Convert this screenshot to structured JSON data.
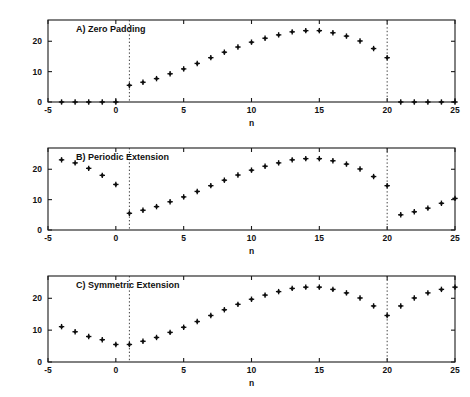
{
  "figure": {
    "title": "",
    "background_color": "#ffffff",
    "marker_color": "#0d0d0d",
    "axis_color": "#1a1a1a",
    "guide_color": "#2b2b2b"
  },
  "panels": [
    {
      "key": "A",
      "title": "A) Zero Padding",
      "xlabel": "n"
    },
    {
      "key": "B",
      "title": "B) Periodic Extension",
      "xlabel": "n"
    },
    {
      "key": "C",
      "title": "C) Symmetric Extension",
      "xlabel": "n"
    }
  ],
  "axes": {
    "xticks": [
      -5,
      0,
      5,
      10,
      15,
      20,
      25
    ],
    "xtick_labels": [
      "-5",
      "0",
      "5",
      "10",
      "15",
      "20",
      "25"
    ],
    "yticks": [
      0,
      10,
      20
    ],
    "ytick_labels": [
      "0",
      "10",
      "20"
    ],
    "xlim": [
      -5,
      25
    ],
    "ylim": [
      0,
      27
    ],
    "xlabel": "n",
    "grid": false,
    "legend": "none",
    "guide_x": [
      1,
      20
    ]
  },
  "chart_data": [
    {
      "type": "scatter",
      "title": "A) Zero Padding",
      "xlabel": "n",
      "ylabel": "",
      "xlim": [
        -5,
        25
      ],
      "ylim": [
        0,
        27
      ],
      "grid": false,
      "legend": "none",
      "marker": "plus-diamond",
      "annotations": [
        "dotted vertical line at n=1",
        "dotted vertical line at n=20"
      ],
      "x": [
        -4,
        -3,
        -2,
        -1,
        0,
        1,
        2,
        3,
        4,
        5,
        6,
        7,
        8,
        9,
        10,
        11,
        12,
        13,
        14,
        15,
        16,
        17,
        18,
        19,
        20,
        21,
        22,
        23,
        24,
        25
      ],
      "values": [
        0,
        0,
        0,
        0,
        0,
        5.5,
        6.5,
        7.7,
        9.3,
        10.9,
        12.7,
        14.6,
        16.4,
        18.1,
        19.7,
        21.0,
        22.1,
        23.1,
        23.5,
        23.5,
        22.8,
        21.7,
        20.1,
        17.6,
        14.6,
        0,
        0,
        0,
        0,
        0
      ]
    },
    {
      "type": "scatter",
      "title": "B) Periodic Extension",
      "xlabel": "n",
      "ylabel": "",
      "xlim": [
        -5,
        25
      ],
      "ylim": [
        0,
        27
      ],
      "grid": false,
      "legend": "none",
      "marker": "plus-diamond",
      "annotations": [
        "dotted vertical line at n=1",
        "dotted vertical line at n=20"
      ],
      "x": [
        -4,
        -3,
        -2,
        -1,
        0,
        1,
        2,
        3,
        4,
        5,
        6,
        7,
        8,
        9,
        10,
        11,
        12,
        13,
        14,
        15,
        16,
        17,
        18,
        19,
        20,
        21,
        22,
        23,
        24,
        25
      ],
      "values": [
        23.1,
        22.1,
        20.3,
        18.0,
        15.0,
        5.5,
        6.5,
        7.7,
        9.3,
        10.9,
        12.7,
        14.6,
        16.4,
        18.1,
        19.7,
        21.0,
        22.1,
        23.1,
        23.5,
        23.5,
        22.8,
        21.7,
        20.1,
        17.6,
        14.6,
        5.0,
        6.0,
        7.2,
        8.8,
        10.4
      ]
    },
    {
      "type": "scatter",
      "title": "C) Symmetric Extension",
      "xlabel": "n",
      "ylabel": "",
      "xlim": [
        -5,
        25
      ],
      "ylim": [
        0,
        27
      ],
      "grid": false,
      "legend": "none",
      "marker": "plus-diamond",
      "annotations": [
        "dotted vertical line at n=1",
        "dotted vertical line at n=20"
      ],
      "x": [
        -4,
        -3,
        -2,
        -1,
        0,
        1,
        2,
        3,
        4,
        5,
        6,
        7,
        8,
        9,
        10,
        11,
        12,
        13,
        14,
        15,
        16,
        17,
        18,
        19,
        20,
        21,
        22,
        23,
        24,
        25
      ],
      "values": [
        11.1,
        9.5,
        8.0,
        7.0,
        5.5,
        5.5,
        6.5,
        7.7,
        9.3,
        10.9,
        12.7,
        14.6,
        16.4,
        18.1,
        19.7,
        21.0,
        22.1,
        23.1,
        23.5,
        23.5,
        22.8,
        21.7,
        20.1,
        17.6,
        14.6,
        17.6,
        20.1,
        21.7,
        22.8,
        23.5
      ]
    }
  ]
}
